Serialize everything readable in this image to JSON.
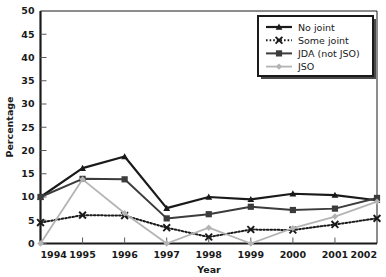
{
  "chart_data": {
    "type": "line",
    "title": "",
    "xlabel": "Year",
    "ylabel": "Percentage",
    "categories": [
      "1994",
      "1995",
      "1996",
      "1997",
      "1998",
      "1999",
      "2000",
      "2001",
      "2002"
    ],
    "x": [
      1994,
      1995,
      1996,
      1997,
      1998,
      1999,
      2000,
      2001,
      2002
    ],
    "xlim": [
      1994,
      2002
    ],
    "ylim": [
      0,
      50
    ],
    "ytick_labels": [
      "0",
      "5",
      "10",
      "15",
      "20",
      "25",
      "30",
      "35",
      "40",
      "45",
      "50"
    ],
    "yticks": [
      0,
      5,
      10,
      15,
      20,
      25,
      30,
      35,
      40,
      45,
      50
    ],
    "grid": false,
    "legend_position": "top-right",
    "series": [
      {
        "name": "No joint",
        "values": [
          10.0,
          16.2,
          18.7,
          7.6,
          10.0,
          9.5,
          10.7,
          10.4,
          9.3
        ],
        "color": "#1a1a1a",
        "marker": "triangle",
        "dash": "none",
        "width": 2.2
      },
      {
        "name": "Some joint",
        "values": [
          4.5,
          6.1,
          6.0,
          3.4,
          1.4,
          3.0,
          2.9,
          4.1,
          5.4
        ],
        "color": "#1a1a1a",
        "marker": "x",
        "dash": "dotted",
        "width": 2.0
      },
      {
        "name": "JDA (not JSO)",
        "values": [
          10.0,
          13.9,
          13.8,
          5.4,
          6.3,
          7.9,
          7.2,
          7.5,
          9.8
        ],
        "color": "#3c3c3c",
        "marker": "square",
        "dash": "none",
        "width": 2.0
      },
      {
        "name": "JSO",
        "values": [
          0.0,
          13.8,
          6.5,
          0.0,
          3.4,
          0.0,
          3.3,
          5.8,
          9.0
        ],
        "color": "#b4b4b4",
        "marker": "diamond",
        "dash": "none",
        "width": 1.8
      }
    ]
  },
  "legend": {
    "entries": [
      {
        "label": "No joint"
      },
      {
        "label": "Some joint"
      },
      {
        "label": "JDA (not JSO)"
      },
      {
        "label": "JSO"
      }
    ]
  },
  "axes": {
    "y_title": "Percentage",
    "x_title": "Year"
  }
}
